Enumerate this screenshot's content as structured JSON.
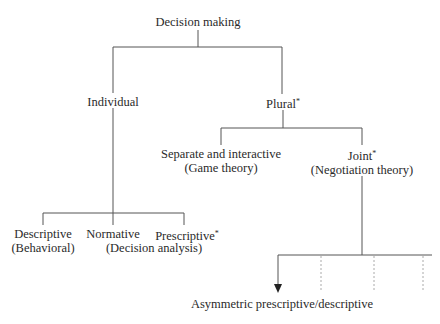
{
  "diagram": {
    "type": "tree",
    "root": {
      "label": "Decision making"
    },
    "level1": [
      {
        "label": "Individual"
      },
      {
        "label": "Plural",
        "marker": "*"
      }
    ],
    "individual_children": [
      {
        "line1": "Descriptive",
        "line2": "(Behavioral)"
      },
      {
        "line1": "Normative"
      },
      {
        "line1": "Prescriptive",
        "marker": "*"
      },
      {
        "shared_subtitle": "(Decision analysis)"
      }
    ],
    "plural_children": [
      {
        "line1": "Separate and interactive",
        "line2": "(Game theory)"
      },
      {
        "line1": "Joint",
        "marker": "*",
        "line2": "(Negotiation theory)"
      }
    ],
    "joint_branch": {
      "target": "Asymmetric prescriptive/descriptive",
      "dotted_branches": 3
    },
    "colors": {
      "line": "#555555",
      "dotted": "#aaaaaa",
      "text": "#2a2a2a"
    }
  }
}
